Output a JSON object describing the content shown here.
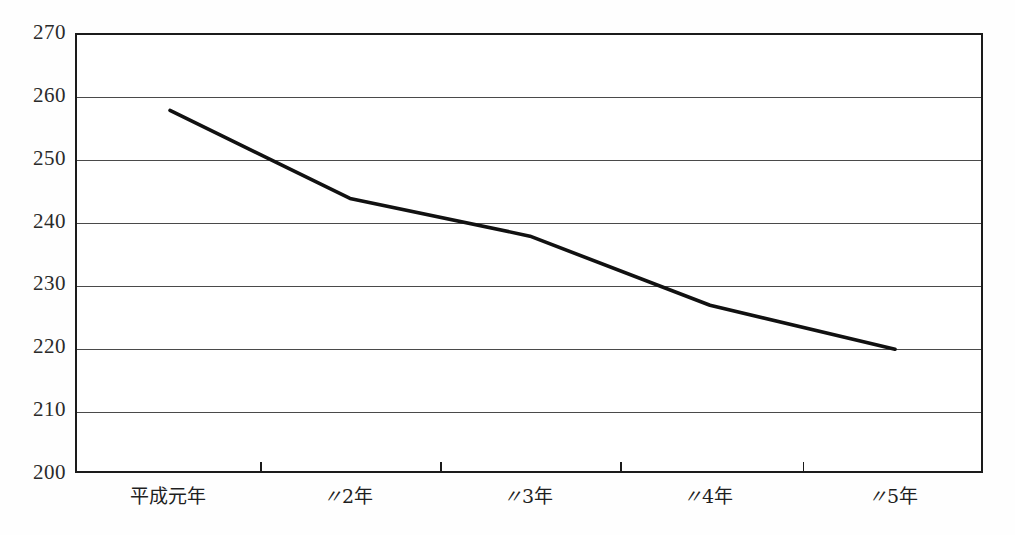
{
  "chart_data": {
    "type": "line",
    "title": "",
    "subtitle": "",
    "xlabel": "",
    "ylabel": "",
    "categories": [
      "平成元年",
      "〃2年",
      "〃3年",
      "〃4年",
      "〃5年"
    ],
    "category_labels_raw": [
      "平成元年",
      "\"2年",
      "\"3年",
      "\"4年",
      "\"5年"
    ],
    "series": [
      {
        "name": "",
        "values": [
          258,
          244,
          238,
          227,
          220
        ]
      }
    ],
    "ylim": [
      200,
      270
    ],
    "yticks": [
      200,
      210,
      220,
      230,
      240,
      250,
      260,
      270
    ],
    "ytick_labels": [
      "200",
      "210",
      "220",
      "230",
      "240",
      "250",
      "260",
      "270"
    ],
    "grid": true,
    "grid_axis": "y",
    "legend": false,
    "legend_position": "none",
    "line_color": "#111111",
    "grid_color": "#4a4a4a",
    "frame_color": "#1b1b1b",
    "background_color": "#ffffff"
  }
}
